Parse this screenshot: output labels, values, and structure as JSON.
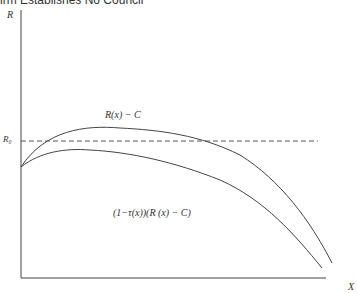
{
  "title": "irm Establishes No Council",
  "axes": {
    "y_label": "R",
    "x_label": "X",
    "ref_label": "R₀"
  },
  "curves": {
    "upper_label": "R(x) − C",
    "lower_label": "(1−τ(x))(R (x) − C)"
  },
  "colors": {
    "line": "#444444",
    "dash": "#555555"
  }
}
